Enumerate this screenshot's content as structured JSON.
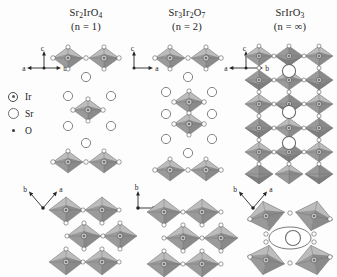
{
  "figure": {
    "background_color": "#fdfdfd"
  },
  "columns": [
    {
      "id": "sr2iro4",
      "formula": "Sr2IrO4",
      "formula_parts": [
        {
          "text": "Sr",
          "sub": false
        },
        {
          "text": "2",
          "sub": true
        },
        {
          "text": "Ir",
          "sub": false
        },
        {
          "text": "O",
          "sub": false
        },
        {
          "text": "4",
          "sub": true
        }
      ],
      "order": "(n = 1)",
      "side_view_axes": {
        "up": "c",
        "left": "a",
        "right": "b"
      },
      "plan_view_axes": {
        "left": "b",
        "right": "a"
      },
      "layer_type": "single-layer"
    },
    {
      "id": "sr3ir2o7",
      "formula": "Sr3Ir2O7",
      "formula_parts": [
        {
          "text": "Sr",
          "sub": false
        },
        {
          "text": "3",
          "sub": true
        },
        {
          "text": "Ir",
          "sub": false
        },
        {
          "text": "2",
          "sub": true
        },
        {
          "text": "O",
          "sub": false
        },
        {
          "text": "7",
          "sub": true
        }
      ],
      "order": "(n = 2)",
      "side_view_axes": {
        "up": "c",
        "right": "a"
      },
      "plan_view_axes": {
        "up": "b",
        "right": "a"
      },
      "layer_type": "bilayer"
    },
    {
      "id": "sriro3",
      "formula": "SrIrO3",
      "formula_parts": [
        {
          "text": "Sr",
          "sub": false
        },
        {
          "text": "Ir",
          "sub": false
        },
        {
          "text": "O",
          "sub": false
        },
        {
          "text": "3",
          "sub": true
        }
      ],
      "order": "(n = ∞)",
      "side_view_axes": {
        "up": "c",
        "left": "a",
        "right": "b"
      },
      "plan_view_axes": {
        "left": "b",
        "right": "a"
      },
      "layer_type": "infinite-3d-network"
    }
  ],
  "legend": {
    "items": [
      {
        "symbol": "Ir",
        "label": "Ir",
        "marker": "circle-with-dot",
        "color": "#4a4a4a"
      },
      {
        "symbol": "Sr",
        "label": "Sr",
        "marker": "open-circle",
        "color": "#6e6e6e"
      },
      {
        "symbol": "O",
        "label": "O",
        "marker": "small-dot",
        "color": "#3a3a3a"
      }
    ]
  },
  "colors": {
    "octahedron_light": "#bcbcbc",
    "octahedron_mid": "#9a9a9a",
    "octahedron_dark": "#7e7e7e",
    "edge": "#6a6a6a",
    "text": "#1b1b1b"
  }
}
